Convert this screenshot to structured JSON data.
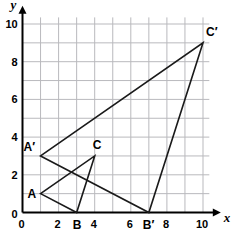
{
  "figure": {
    "background_color": "#ffffff",
    "grid_color": "#b9b9bd",
    "axis_color": "#000000",
    "shape_color": "#1a1a1a"
  },
  "axes": {
    "x_name": "x",
    "y_name": "y",
    "x_min": 0,
    "x_max": 10.4,
    "y_min": 0,
    "y_max": 10.4,
    "grid_step": 1,
    "tick_step": 2,
    "x_ticks": [
      {
        "value": 0,
        "label": "0"
      },
      {
        "value": 2,
        "label": "2"
      },
      {
        "value": 4,
        "label": "4"
      },
      {
        "value": 6,
        "label": "6"
      },
      {
        "value": 8,
        "label": "8"
      },
      {
        "value": 10,
        "label": "10"
      }
    ],
    "y_ticks": [
      {
        "value": 0,
        "label": "0"
      },
      {
        "value": 2,
        "label": "2"
      },
      {
        "value": 4,
        "label": "4"
      },
      {
        "value": 6,
        "label": "6"
      },
      {
        "value": 8,
        "label": "8"
      },
      {
        "value": 10,
        "label": "10"
      }
    ]
  },
  "chart_data": {
    "type": "scatter",
    "title": "",
    "xlabel": "x",
    "ylabel": "y",
    "xlim": [
      0,
      10.4
    ],
    "ylim": [
      0,
      10.4
    ],
    "grid": true,
    "legend": "none",
    "series": [
      {
        "name": "Triangle ABC",
        "closed": true,
        "points": [
          {
            "label": "A",
            "x": 1,
            "y": 1
          },
          {
            "label": "B",
            "x": 3,
            "y": 0
          },
          {
            "label": "C",
            "x": 4,
            "y": 3
          }
        ]
      },
      {
        "name": "Triangle A'B'C'",
        "closed": true,
        "points": [
          {
            "label": "A′",
            "x": 1,
            "y": 3
          },
          {
            "label": "B′",
            "x": 7,
            "y": 0
          },
          {
            "label": "C′",
            "x": 10,
            "y": 9
          }
        ]
      }
    ]
  },
  "vertex_labels": [
    {
      "key": "A",
      "text": "A",
      "x": 1,
      "y": 1
    },
    {
      "key": "B",
      "text": "B",
      "x": 3,
      "y": 0
    },
    {
      "key": "C",
      "text": "C",
      "x": 4,
      "y": 3
    },
    {
      "key": "Aprime",
      "text": "A′",
      "x": 1,
      "y": 3
    },
    {
      "key": "Bprime",
      "text": "B′",
      "x": 7,
      "y": 0
    },
    {
      "key": "Cprime",
      "text": "C′",
      "x": 10,
      "y": 9
    }
  ]
}
